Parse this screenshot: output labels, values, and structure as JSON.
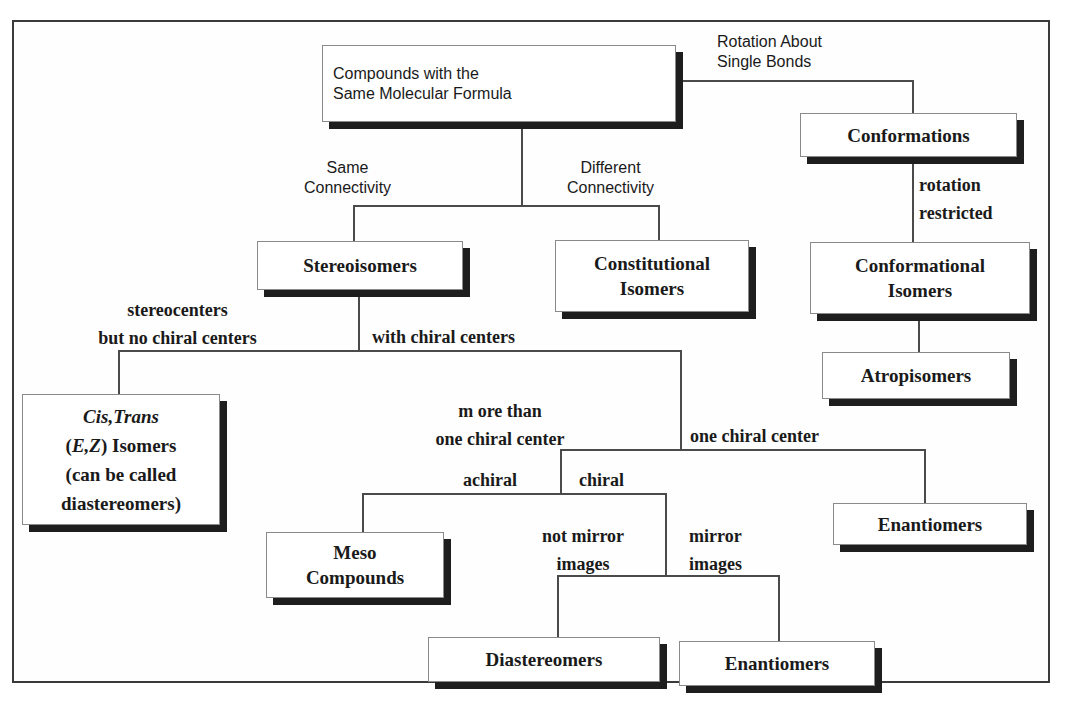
{
  "diagram": {
    "nodes": {
      "root": {
        "lines": [
          "Compounds with the",
          "Same Molecular Formula"
        ]
      },
      "conformations": {
        "lines": [
          "Conformations"
        ]
      },
      "conformational_isomers": {
        "lines": [
          "Conformational",
          "Isomers"
        ]
      },
      "atropisomers": {
        "lines": [
          "Atropisomers"
        ]
      },
      "stereoisomers": {
        "lines": [
          "Stereoisomers"
        ]
      },
      "constitutional_isomers": {
        "lines": [
          "Constitutional",
          "Isomers"
        ]
      },
      "cis_trans": {
        "line1_italic": "Cis,Trans",
        "line2_open": "(",
        "line2_italic": "E,Z",
        "line2_rest": ") Isomers",
        "line3": "(can be called",
        "line4": "diastereomers)"
      },
      "enantiomers_one_center": {
        "lines": [
          "Enantiomers"
        ]
      },
      "meso_compounds": {
        "lines": [
          "Meso",
          "Compounds"
        ]
      },
      "diastereomers": {
        "lines": [
          "Diastereomers"
        ]
      },
      "enantiomers_mirror": {
        "lines": [
          "Enantiomers"
        ]
      }
    },
    "edge_labels": {
      "rotation_single_bonds": [
        "Rotation About",
        "Single Bonds"
      ],
      "same_connectivity": [
        "Same",
        "Connectivity"
      ],
      "different_connectivity": [
        "Different",
        "Connectivity"
      ],
      "rotation_restricted": [
        "rotation",
        "restricted"
      ],
      "stereocenters_no_chiral": [
        "stereocenters",
        "but no chiral centers"
      ],
      "with_chiral_centers": [
        "with chiral centers"
      ],
      "more_than_one": [
        "m ore than",
        "one chiral center"
      ],
      "one_chiral_center": [
        "one chiral center"
      ],
      "achiral": [
        "achiral"
      ],
      "chiral": [
        "chiral"
      ],
      "not_mirror_images": [
        "not mirror",
        "images"
      ],
      "mirror_images": [
        "mirror",
        "images"
      ]
    },
    "colors": {
      "line": "#4a4a4a",
      "box_border": "#8a8a8a",
      "box_shadow": "#1e1e1e",
      "text": "#1a1a1a",
      "background": "#ffffff"
    }
  }
}
